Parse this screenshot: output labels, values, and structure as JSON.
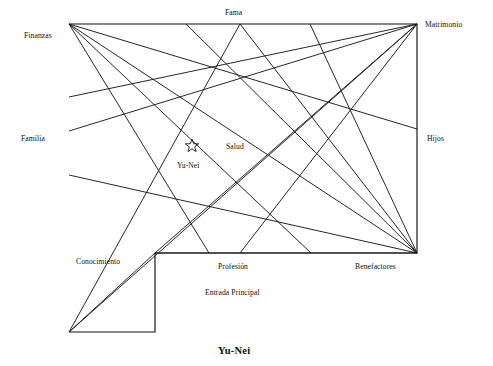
{
  "figure": {
    "caption": "Yu-Nei",
    "center_marker_label": "Yu-Nei",
    "center_marker_icon": "star-outline-icon",
    "ink_color": "#111111",
    "background_color": "#ffffff"
  },
  "bagua_zones": [
    {
      "id": "fama",
      "label": "Fama",
      "x": 225,
      "y": 9,
      "side": "top"
    },
    {
      "id": "matrimonio",
      "label": "Matrimonio",
      "x": 425,
      "y": 21,
      "side": "top-right"
    },
    {
      "id": "finanzas",
      "label": "Finanzas",
      "x": 24,
      "y": 32,
      "side": "top-left"
    },
    {
      "id": "familia",
      "label": "Familia",
      "x": 21,
      "y": 135,
      "side": "left"
    },
    {
      "id": "hijos",
      "label": "Hijos",
      "x": 427,
      "y": 135,
      "side": "right"
    },
    {
      "id": "salud",
      "label": "Salud",
      "x": 226,
      "y": 143,
      "side": "center"
    },
    {
      "id": "conocimiento",
      "label": "Conocimiento",
      "x": 76,
      "y": 258,
      "side": "bottom-left"
    },
    {
      "id": "profesion",
      "label": "Profesión",
      "x": 218,
      "y": 263,
      "side": "bottom"
    },
    {
      "id": "benefactores",
      "label": "Benefactores",
      "x": 355,
      "y": 263,
      "side": "bottom-right"
    },
    {
      "id": "entrada-principal",
      "label": "Entrada Principal",
      "x": 205,
      "y": 289,
      "side": "bottom"
    },
    {
      "id": "yu-nei-center",
      "label": "Yu-Nei",
      "x": 177,
      "y": 162,
      "side": "center"
    }
  ],
  "floor_outline": {
    "type": "L-shaped",
    "points": "69,24 417,24 417,253 155,253 155,332 69,332"
  },
  "center_star": {
    "cx": 192,
    "cy": 146,
    "r": 7
  },
  "sight_lines": [
    {
      "from": [
        69,
        24
      ],
      "to": [
        209,
        253
      ]
    },
    {
      "from": [
        69,
        24
      ],
      "to": [
        417,
        129
      ]
    },
    {
      "from": [
        69,
        24
      ],
      "to": [
        417,
        253
      ]
    },
    {
      "from": [
        69,
        24
      ],
      "to": [
        311,
        253
      ]
    },
    {
      "from": [
        417,
        24
      ],
      "to": [
        69,
        131
      ]
    },
    {
      "from": [
        417,
        24
      ],
      "to": [
        69,
        97
      ]
    },
    {
      "from": [
        417,
        24
      ],
      "to": [
        155,
        253
      ]
    },
    {
      "from": [
        417,
        24
      ],
      "to": [
        240,
        253
      ]
    },
    {
      "from": [
        417,
        24
      ],
      "to": [
        69,
        332
      ]
    },
    {
      "from": [
        417,
        253
      ],
      "to": [
        69,
        175
      ]
    },
    {
      "from": [
        417,
        253
      ],
      "to": [
        186,
        24
      ]
    },
    {
      "from": [
        417,
        253
      ],
      "to": [
        240,
        24
      ]
    },
    {
      "from": [
        417,
        253
      ],
      "to": [
        310,
        24
      ]
    },
    {
      "from": [
        417,
        253
      ],
      "to": [
        155,
        253
      ]
    },
    {
      "from": [
        69,
        332
      ],
      "to": [
        155,
        253
      ]
    },
    {
      "from": [
        69,
        332
      ],
      "to": [
        240,
        24
      ]
    }
  ]
}
